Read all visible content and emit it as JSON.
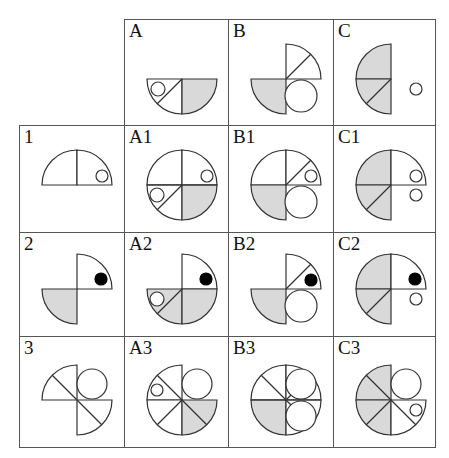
{
  "puzzle": {
    "title": "Shape combination matrix",
    "style": {
      "line_color": "#333333",
      "shade_color": "#d9d9d9",
      "dot_color": "#000000",
      "background": "#ffffff"
    },
    "columns": [
      "A",
      "B",
      "C"
    ],
    "rows": [
      "1",
      "2",
      "3"
    ],
    "cells": [
      {
        "id": "A",
        "label": "A",
        "x": 124,
        "y": 19,
        "w": 105,
        "h": 107,
        "figure": {
          "cx": 57,
          "cy": 59,
          "r": 35,
          "wedges": [
            {
              "q": "BL",
              "fill": "none"
            },
            {
              "q": "BR",
              "fill": "shade"
            }
          ],
          "lines": [
            {
              "from": "center",
              "to": "BL45"
            }
          ],
          "circles": [
            {
              "dx": -24,
              "dy": 10,
              "r": 7,
              "fill": "none"
            }
          ]
        }
      },
      {
        "id": "B",
        "label": "B",
        "x": 228,
        "y": 19,
        "w": 106,
        "h": 107,
        "figure": {
          "cx": 57,
          "cy": 59,
          "r": 35,
          "wedges": [
            {
              "q": "TR",
              "fill": "none"
            },
            {
              "q": "BL",
              "fill": "shade"
            }
          ],
          "lines": [
            {
              "from": "center",
              "to": "TR45"
            }
          ],
          "circles": [
            {
              "dx": 15,
              "dy": 17,
              "r": 16,
              "fill": "none"
            }
          ]
        }
      },
      {
        "id": "C",
        "label": "C",
        "x": 333,
        "y": 19,
        "w": 103,
        "h": 107,
        "figure": {
          "cx": 57,
          "cy": 59,
          "r": 35,
          "wedges": [
            {
              "q": "TL",
              "fill": "shade"
            },
            {
              "q": "BL",
              "fill": "shade"
            }
          ],
          "lines": [
            {
              "from": "center",
              "to": "BL45"
            }
          ],
          "circles": [
            {
              "dx": 25,
              "dy": 10,
              "r": 6,
              "fill": "none"
            }
          ]
        }
      },
      {
        "id": "1",
        "label": "1",
        "x": 19,
        "y": 125,
        "w": 106,
        "h": 108,
        "figure": {
          "cx": 57,
          "cy": 59,
          "r": 35,
          "wedges": [
            {
              "q": "TL",
              "fill": "none"
            },
            {
              "q": "TR",
              "fill": "none"
            }
          ],
          "lines": [],
          "circles": [
            {
              "dx": 25,
              "dy": -9,
              "r": 6,
              "fill": "none"
            }
          ]
        }
      },
      {
        "id": "A1",
        "label": "A1",
        "x": 124,
        "y": 125,
        "w": 105,
        "h": 108,
        "figure": {
          "cx": 57,
          "cy": 59,
          "r": 35,
          "wedges": [
            {
              "q": "TL",
              "fill": "none"
            },
            {
              "q": "TR",
              "fill": "none"
            },
            {
              "q": "BL",
              "fill": "none"
            },
            {
              "q": "BR",
              "fill": "shade"
            }
          ],
          "lines": [
            {
              "from": "center",
              "to": "BL45"
            },
            {
              "from": "W",
              "to": "E"
            }
          ],
          "circles": [
            {
              "dx": 25,
              "dy": -9,
              "r": 6,
              "fill": "none"
            },
            {
              "dx": -25,
              "dy": 10,
              "r": 7,
              "fill": "none"
            }
          ]
        }
      },
      {
        "id": "B1",
        "label": "B1",
        "x": 228,
        "y": 125,
        "w": 106,
        "h": 108,
        "figure": {
          "cx": 57,
          "cy": 59,
          "r": 35,
          "wedges": [
            {
              "q": "TL",
              "fill": "none"
            },
            {
              "q": "TR",
              "fill": "none"
            },
            {
              "q": "BL",
              "fill": "shade"
            }
          ],
          "lines": [
            {
              "from": "center",
              "to": "TR45"
            }
          ],
          "circles": [
            {
              "dx": 25,
              "dy": -9,
              "r": 6,
              "fill": "none"
            },
            {
              "dx": 15,
              "dy": 17,
              "r": 16,
              "fill": "none"
            }
          ]
        }
      },
      {
        "id": "C1",
        "label": "C1",
        "x": 333,
        "y": 125,
        "w": 103,
        "h": 108,
        "figure": {
          "cx": 57,
          "cy": 59,
          "r": 35,
          "wedges": [
            {
              "q": "TL",
              "fill": "shade"
            },
            {
              "q": "TR",
              "fill": "none"
            },
            {
              "q": "BL",
              "fill": "shade"
            }
          ],
          "lines": [
            {
              "from": "center",
              "to": "BL45"
            }
          ],
          "circles": [
            {
              "dx": 25,
              "dy": -9,
              "r": 6,
              "fill": "none"
            },
            {
              "dx": 25,
              "dy": 10,
              "r": 6,
              "fill": "none"
            }
          ]
        }
      },
      {
        "id": "2",
        "label": "2",
        "x": 19,
        "y": 232,
        "w": 106,
        "h": 105,
        "figure": {
          "cx": 57,
          "cy": 56,
          "r": 35,
          "wedges": [
            {
              "q": "TR",
              "fill": "none"
            },
            {
              "q": "BL",
              "fill": "shade"
            }
          ],
          "lines": [],
          "circles": [
            {
              "dx": 24,
              "dy": -10,
              "r": 6,
              "fill": "dot"
            }
          ]
        }
      },
      {
        "id": "A2",
        "label": "A2",
        "x": 124,
        "y": 232,
        "w": 105,
        "h": 105,
        "figure": {
          "cx": 57,
          "cy": 56,
          "r": 35,
          "wedges": [
            {
              "q": "TR",
              "fill": "none"
            },
            {
              "q": "BL",
              "fill": "shade"
            },
            {
              "q": "BR",
              "fill": "shade"
            }
          ],
          "lines": [
            {
              "from": "center",
              "to": "BL45"
            }
          ],
          "circles": [
            {
              "dx": 24,
              "dy": -10,
              "r": 6,
              "fill": "dot"
            },
            {
              "dx": -25,
              "dy": 10,
              "r": 7,
              "fill": "none"
            }
          ]
        }
      },
      {
        "id": "B2",
        "label": "B2",
        "x": 228,
        "y": 232,
        "w": 106,
        "h": 105,
        "figure": {
          "cx": 57,
          "cy": 56,
          "r": 35,
          "wedges": [
            {
              "q": "TR",
              "fill": "none"
            },
            {
              "q": "BL",
              "fill": "shade"
            }
          ],
          "lines": [
            {
              "from": "center",
              "to": "TR45"
            }
          ],
          "circles": [
            {
              "dx": 25,
              "dy": -9,
              "r": 6,
              "fill": "dot"
            },
            {
              "dx": 15,
              "dy": 17,
              "r": 16,
              "fill": "none"
            }
          ]
        }
      },
      {
        "id": "C2",
        "label": "C2",
        "x": 333,
        "y": 232,
        "w": 103,
        "h": 105,
        "figure": {
          "cx": 57,
          "cy": 56,
          "r": 35,
          "wedges": [
            {
              "q": "TL",
              "fill": "shade"
            },
            {
              "q": "TR",
              "fill": "none"
            },
            {
              "q": "BL",
              "fill": "shade"
            }
          ],
          "lines": [
            {
              "from": "center",
              "to": "BL45"
            }
          ],
          "circles": [
            {
              "dx": 24,
              "dy": -10,
              "r": 6,
              "fill": "dot"
            },
            {
              "dx": 25,
              "dy": 10,
              "r": 6,
              "fill": "none"
            }
          ]
        }
      },
      {
        "id": "3",
        "label": "3",
        "x": 19,
        "y": 336,
        "w": 106,
        "h": 112,
        "figure": {
          "cx": 57,
          "cy": 63,
          "r": 35,
          "wedges": [
            {
              "q": "TL",
              "fill": "none"
            },
            {
              "q": "BR",
              "fill": "none"
            }
          ],
          "lines": [
            {
              "from": "TL45",
              "to": "BR45"
            }
          ],
          "circles": [
            {
              "dx": 15,
              "dy": -16,
              "r": 15,
              "fill": "none"
            }
          ]
        }
      },
      {
        "id": "A3",
        "label": "A3",
        "x": 124,
        "y": 336,
        "w": 105,
        "h": 112,
        "figure": {
          "cx": 57,
          "cy": 63,
          "r": 35,
          "wedges": [
            {
              "q": "TL",
              "fill": "none"
            },
            {
              "q": "BL",
              "fill": "none"
            },
            {
              "q": "BR",
              "fill": "shade"
            }
          ],
          "lines": [
            {
              "from": "TL45",
              "to": "BR45"
            },
            {
              "from": "center",
              "to": "BL45"
            }
          ],
          "circles": [
            {
              "dx": 15,
              "dy": -16,
              "r": 15,
              "fill": "none"
            },
            {
              "dx": -25,
              "dy": -10,
              "r": 6,
              "fill": "none"
            }
          ]
        }
      },
      {
        "id": "B3",
        "label": "B3",
        "x": 228,
        "y": 336,
        "w": 106,
        "h": 112,
        "figure": {
          "cx": 57,
          "cy": 63,
          "r": 35,
          "wedges": [
            {
              "q": "TL",
              "fill": "none"
            },
            {
              "q": "TR",
              "fill": "none"
            },
            {
              "q": "BL",
              "fill": "shade"
            },
            {
              "q": "BR",
              "fill": "none"
            }
          ],
          "lines": [
            {
              "from": "TL45",
              "to": "BR45"
            },
            {
              "from": "center",
              "to": "TR45"
            },
            {
              "from": "W",
              "to": "E"
            }
          ],
          "circles": [
            {
              "dx": 15,
              "dy": -16,
              "r": 15,
              "fill": "none"
            },
            {
              "dx": 15,
              "dy": 16,
              "r": 15,
              "fill": "none"
            }
          ]
        }
      },
      {
        "id": "C3",
        "label": "C3",
        "x": 333,
        "y": 336,
        "w": 103,
        "h": 112,
        "figure": {
          "cx": 57,
          "cy": 63,
          "r": 35,
          "wedges": [
            {
              "q": "TL",
              "fill": "shade"
            },
            {
              "q": "BL",
              "fill": "shade"
            },
            {
              "q": "BR",
              "fill": "none"
            }
          ],
          "lines": [
            {
              "from": "TL45",
              "to": "BR45"
            },
            {
              "from": "center",
              "to": "BL45"
            }
          ],
          "circles": [
            {
              "dx": 15,
              "dy": -16,
              "r": 15,
              "fill": "none"
            },
            {
              "dx": 25,
              "dy": 10,
              "r": 6,
              "fill": "none"
            }
          ]
        }
      }
    ]
  }
}
